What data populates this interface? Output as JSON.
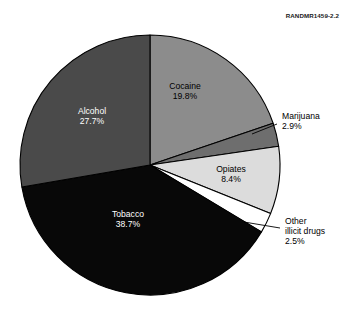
{
  "figure": {
    "source_credit": "RANDMR1459-2.2"
  },
  "chart_data": {
    "type": "pie",
    "title": "",
    "subtitle": "",
    "xlabel": "",
    "ylabel": "",
    "legend_position": "none",
    "grid": false,
    "start_angle_deg": 0,
    "direction": "clockwise",
    "units": "percent",
    "total": 100.0,
    "categories": [
      "Cocaine",
      "Marijuana",
      "Opiates",
      "Other illicit drugs",
      "Tobacco",
      "Alcohol"
    ],
    "values": [
      19.8,
      2.9,
      8.4,
      2.5,
      38.7,
      27.7
    ],
    "slices": [
      {
        "label": "Cocaine",
        "value": 19.8,
        "value_text": "19.8%",
        "color": "#8c8c8c",
        "label_color": "#000000",
        "label_placement": "inside",
        "label_lines": [
          "Cocaine",
          "19.8%"
        ]
      },
      {
        "label": "Marijuana",
        "value": 2.9,
        "value_text": "2.9%",
        "color": "#6e6e6e",
        "label_color": "#000000",
        "label_placement": "outside",
        "label_lines": [
          "Marijuana",
          "2.9%"
        ]
      },
      {
        "label": "Opiates",
        "value": 8.4,
        "value_text": "8.4%",
        "color": "#dcdcdc",
        "label_color": "#000000",
        "label_placement": "inside",
        "label_lines": [
          "Opiates",
          "8.4%"
        ]
      },
      {
        "label": "Other illicit drugs",
        "value": 2.5,
        "value_text": "2.5%",
        "color": "#ffffff",
        "label_color": "#000000",
        "label_placement": "outside",
        "label_lines": [
          "Other",
          "illicit drugs",
          "2.5%"
        ]
      },
      {
        "label": "Tobacco",
        "value": 38.7,
        "value_text": "38.7%",
        "color": "#080808",
        "label_color": "#ffffff",
        "label_placement": "inside",
        "label_lines": [
          "Tobacco",
          "38.7%"
        ]
      },
      {
        "label": "Alcohol",
        "value": 27.7,
        "value_text": "27.7%",
        "color": "#4a4a4a",
        "label_color": "#ffffff",
        "label_placement": "inside",
        "label_lines": [
          "Alcohol",
          "27.7%"
        ]
      }
    ]
  },
  "geometry": {
    "cx": 150,
    "cy": 165,
    "r": 130,
    "stroke": "#000000",
    "stroke_width": 1.1
  },
  "label_positions": {
    "Cocaine": {
      "x": 185,
      "y": 92
    },
    "Opiates": {
      "x": 231,
      "y": 175
    },
    "Tobacco": {
      "x": 128,
      "y": 220
    },
    "Alcohol": {
      "x": 92,
      "y": 117
    },
    "Marijuana": {
      "x": 282,
      "y": 122
    },
    "Other illicit drugs": {
      "x": 285,
      "y": 232
    }
  },
  "leader_lines": {
    "Marijuana": {
      "x1": 252,
      "y1": 134,
      "x2": 277,
      "y2": 124
    },
    "Other illicit drugs": {
      "x1": 244,
      "y1": 222,
      "x2": 280,
      "y2": 228
    }
  }
}
